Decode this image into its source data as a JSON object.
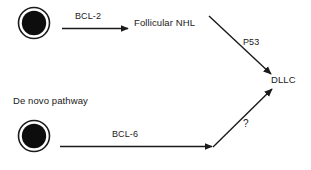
{
  "diagram": {
    "type": "flow-diagram",
    "background_color": "#ffffff",
    "stroke_color": "#1a1a1a",
    "nodes": [
      {
        "id": "cell-top",
        "kind": "ringed-cell",
        "label": "",
        "cx": 34,
        "cy": 23,
        "outer_r": 16,
        "inner_r": 12.5
      },
      {
        "id": "follicular-nhl",
        "kind": "text",
        "label": "Follicular NHL"
      },
      {
        "id": "dllc",
        "kind": "text",
        "label": "DLLC"
      },
      {
        "id": "de-novo-pathway",
        "kind": "text",
        "label": "De novo pathway"
      },
      {
        "id": "cell-bottom",
        "kind": "ringed-cell",
        "label": "",
        "cx": 34,
        "cy": 136,
        "outer_r": 16,
        "inner_r": 12.5
      }
    ],
    "edges": [
      {
        "id": "edge-bcl2",
        "label": "BCL-2",
        "from": "cell-top",
        "to": "follicular-nhl",
        "orientation": "horizontal"
      },
      {
        "id": "edge-p53",
        "label": "P53",
        "from": "follicular-nhl",
        "to": "dllc",
        "orientation": "diagonal-down"
      },
      {
        "id": "edge-bcl6",
        "label": "BCL-6",
        "from": "cell-bottom",
        "to": "junction",
        "orientation": "horizontal"
      },
      {
        "id": "edge-question",
        "label": "?",
        "from": "junction",
        "to": "dllc",
        "orientation": "diagonal-up"
      }
    ]
  }
}
